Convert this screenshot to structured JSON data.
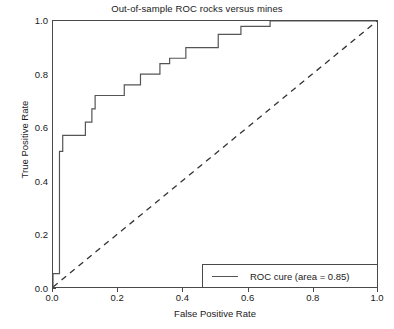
{
  "chart_data": {
    "type": "line",
    "title": "Out-of-sample ROC rocks versus mines",
    "xlabel": "False Positive Rate",
    "ylabel": "True Positive Rate",
    "xlim": [
      0.0,
      1.0
    ],
    "ylim": [
      0.0,
      1.0
    ],
    "grid": false,
    "xticks": [
      "0.0",
      "0.2",
      "0.4",
      "0.6",
      "0.8",
      "1.0"
    ],
    "xtick_values": [
      0.0,
      0.2,
      0.4,
      0.6,
      0.8,
      1.0
    ],
    "yticks": [
      "0.0",
      "0.2",
      "0.4",
      "0.6",
      "0.8",
      "1.0"
    ],
    "ytick_values": [
      0.0,
      0.2,
      0.4,
      0.6,
      0.8,
      1.0
    ],
    "legend_position": "lower right",
    "series": [
      {
        "name": "ROC cure (area = 0.85)",
        "style": "step",
        "color": "#555555",
        "x": [
          0.0,
          0.0,
          0.02,
          0.02,
          0.03,
          0.03,
          0.06,
          0.06,
          0.1,
          0.1,
          0.12,
          0.12,
          0.13,
          0.13,
          0.19,
          0.19,
          0.22,
          0.22,
          0.27,
          0.27,
          0.3,
          0.3,
          0.33,
          0.33,
          0.36,
          0.36,
          0.41,
          0.41,
          0.45,
          0.45,
          0.51,
          0.51,
          0.58,
          0.58,
          0.67,
          0.67,
          1.0
        ],
        "y": [
          0.0,
          0.05,
          0.05,
          0.51,
          0.51,
          0.57,
          0.57,
          0.57,
          0.57,
          0.62,
          0.62,
          0.67,
          0.67,
          0.72,
          0.72,
          0.72,
          0.72,
          0.76,
          0.76,
          0.8,
          0.8,
          0.8,
          0.8,
          0.84,
          0.84,
          0.86,
          0.86,
          0.9,
          0.9,
          0.9,
          0.9,
          0.95,
          0.95,
          0.98,
          0.98,
          1.0,
          1.0
        ]
      },
      {
        "name": "chance-diagonal",
        "style": "dashed",
        "color": "#333333",
        "x": [
          0.0,
          1.0
        ],
        "y": [
          0.0,
          1.0
        ]
      }
    ],
    "annotations": {
      "area_under_curve": 0.85
    }
  },
  "legend": {
    "entry_label": "ROC cure (area = 0.85)"
  }
}
